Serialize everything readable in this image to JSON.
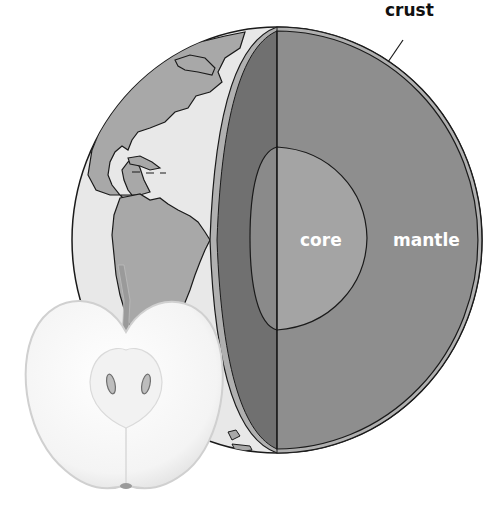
{
  "diagram": {
    "labels": {
      "crust": "crust",
      "core": "core",
      "mantle": "mantle"
    },
    "colors": {
      "background": "#ffffff",
      "ocean": "#e8e8e8",
      "land": "#a8a8a8",
      "crust_band": "#b0b0b0",
      "cut_face_edge": "#707070",
      "mantle": "#8e8e8e",
      "core": "#a4a4a4",
      "outline": "#1a1a1a",
      "apple_flesh": "#f7f7f7",
      "apple_outline": "#d0d0d0",
      "label_dark": "#111111",
      "label_light": "#ffffff"
    },
    "elements": [
      "globe",
      "crust",
      "mantle",
      "core",
      "continents",
      "apple-half",
      "apple-seeds",
      "apple-stem"
    ]
  }
}
